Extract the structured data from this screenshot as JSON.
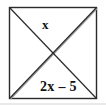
{
  "figure": {
    "type": "geometry-diagram",
    "shape": "square",
    "labels": {
      "top": "x",
      "bottom": "2x – 5"
    },
    "colors": {
      "outline": "#2b2b2b",
      "diagonal": "#2b2b2b",
      "diagonal_secondary": "#9a9a9a",
      "background": "#ffffff",
      "text": "#111111"
    },
    "square": {
      "left": 9,
      "top": 7,
      "right": 97,
      "bottom": 99
    },
    "diagonals": [
      {
        "name": "top-left-to-bottom-right",
        "from": [
          9,
          7
        ],
        "to": [
          97,
          99
        ]
      },
      {
        "name": "bottom-left-to-top-right",
        "from": [
          9,
          99
        ],
        "to": [
          97,
          7
        ]
      }
    ]
  }
}
